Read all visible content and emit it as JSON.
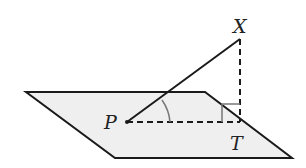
{
  "diagram": {
    "type": "3D geometry: line meeting a plane",
    "colors": {
      "plane_fill": "#efefef",
      "stroke": "#1a1a1a",
      "angle_mark": "#777777"
    },
    "points": {
      "P": {
        "label": "P",
        "description": "point where line XP meets the plane"
      },
      "X": {
        "label": "X",
        "description": "point above the plane"
      },
      "T": {
        "label": "T",
        "description": "foot of perpendicular from X onto the plane"
      }
    },
    "segments": [
      {
        "name": "PX",
        "style": "solid",
        "description": "line from P to X"
      },
      {
        "name": "PT",
        "style": "dashed",
        "description": "projection of PX onto the plane"
      },
      {
        "name": "XT",
        "style": "dashed",
        "description": "perpendicular from X to plane"
      }
    ],
    "markers": [
      {
        "name": "angle-XPT",
        "kind": "angle arc"
      },
      {
        "name": "right-angle-T",
        "kind": "right angle square"
      }
    ]
  }
}
